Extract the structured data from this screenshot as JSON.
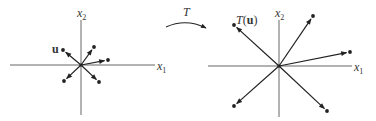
{
  "left_plot": {
    "x_axis_label": "x",
    "x_axis_sub": "1",
    "y_axis_label": "x",
    "y_axis_sub": "2",
    "vector_label": "u",
    "origin": [
      81,
      65
    ],
    "vectors": [
      {
        "name": "u",
        "end": [
          63,
          50
        ]
      },
      {
        "name": "v2",
        "end": [
          94,
          47
        ]
      },
      {
        "name": "v3",
        "end": [
          108,
          60
        ]
      },
      {
        "name": "v4",
        "end": [
          64,
          81
        ]
      },
      {
        "name": "v5",
        "end": [
          99,
          82
        ]
      }
    ]
  },
  "transform": {
    "label": "T"
  },
  "right_plot": {
    "x_axis_label": "x",
    "x_axis_sub": "1",
    "y_axis_label": "x",
    "y_axis_sub": "2",
    "vector_label_func": "T",
    "vector_label_arg": "u",
    "origin": [
      279,
      66
    ],
    "vectors": [
      {
        "name": "T(u)",
        "end": [
          234,
          25
        ]
      },
      {
        "name": "T(v2)",
        "end": [
          313,
          16
        ]
      },
      {
        "name": "T(v3)",
        "end": [
          350,
          52
        ]
      },
      {
        "name": "T(v4)",
        "end": [
          234,
          106
        ]
      },
      {
        "name": "T(v5)",
        "end": [
          327,
          111
        ]
      }
    ]
  },
  "colors": {
    "axis": "#555555",
    "vector": "#222222",
    "text": "#333333"
  }
}
